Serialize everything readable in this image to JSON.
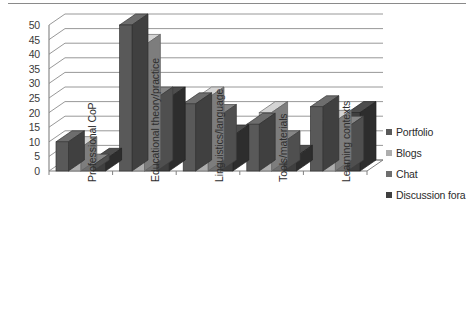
{
  "chart_data": {
    "type": "bar",
    "title": "",
    "subtitle": "",
    "xlabel": "",
    "ylabel": "",
    "ylim": [
      0,
      50
    ],
    "ytick_step": 5,
    "yticks": [
      "50",
      "45",
      "40",
      "35",
      "30",
      "25",
      "20",
      "15",
      "10",
      "5",
      "0"
    ],
    "grid": true,
    "grid_axis": "y",
    "legend_position": "right",
    "style": "3d-clustered-column",
    "categories": [
      "Professional CoP",
      "Educational theory/practice",
      "Linguistics/language",
      "Tools/materials",
      "Learning contexts"
    ],
    "series": [
      {
        "name": "Portfolio",
        "color": "#595959",
        "values": [
          10,
          50,
          23,
          16,
          22
        ]
      },
      {
        "name": "Blogs",
        "color": "#aeaeae",
        "values": [
          8,
          43,
          25,
          20,
          17
        ]
      },
      {
        "name": "Chat",
        "color": "#6e6e6e",
        "values": [
          2,
          25,
          19,
          10,
          15
        ]
      },
      {
        "name": "Discussion fora",
        "color": "#3f3f3f",
        "values": [
          4,
          25,
          12,
          5,
          20
        ]
      }
    ]
  },
  "legend": {
    "items": [
      {
        "label": "Portfolio"
      },
      {
        "label": "Blogs"
      },
      {
        "label": "Chat"
      },
      {
        "label": "Discussion fora"
      }
    ]
  },
  "colors": {
    "axis": "#808080",
    "gridline": "#8c8c8c",
    "text": "#2e2e2e",
    "background": "#ffffff"
  }
}
